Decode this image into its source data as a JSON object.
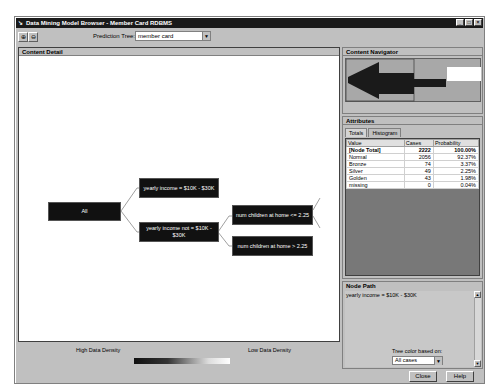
{
  "window": {
    "title": "Data Mining Model Browser - Member Card RDBMS",
    "controls": [
      "minimize",
      "maximize",
      "close"
    ]
  },
  "toolbar": {
    "zoom_in_icon": "zoom-in-icon",
    "zoom_out_icon": "zoom-out-icon",
    "prediction_tree_label": "Prediction Tree:",
    "prediction_tree_value": "member card"
  },
  "content_detail": {
    "title": "Content Detail",
    "nodes": [
      {
        "id": "all",
        "label": "All"
      },
      {
        "id": "income-yes",
        "label": "yearly income = $10K - $30K"
      },
      {
        "id": "income-no",
        "label": "yearly income not = $10K - $30K"
      },
      {
        "id": "children-le",
        "label": "num children at home <= 2.25"
      },
      {
        "id": "children-gt",
        "label": "num children at home > 2.25"
      }
    ]
  },
  "content_navigator": {
    "title": "Content Navigator"
  },
  "attributes": {
    "title": "Attributes",
    "tabs": [
      {
        "label": "Totals",
        "active": true
      },
      {
        "label": "Histogram",
        "active": false
      }
    ],
    "columns": [
      "Value",
      "Cases",
      "Probability"
    ],
    "rows": [
      {
        "value": "[Node Total]",
        "cases": "2222",
        "probability": "100.00%",
        "bold": true
      },
      {
        "value": "Normal",
        "cases": "2056",
        "probability": "92.37%"
      },
      {
        "value": "Bronze",
        "cases": "74",
        "probability": "3.37%"
      },
      {
        "value": "Silver",
        "cases": "49",
        "probability": "2.25%"
      },
      {
        "value": "Golden",
        "cases": "43",
        "probability": "1.98%"
      },
      {
        "value": "missing",
        "cases": "0",
        "probability": "0.04%"
      }
    ]
  },
  "node_path": {
    "title": "Node Path",
    "text": "yearly income = $10K - $30K"
  },
  "legend": {
    "high_label": "High Data Density",
    "low_label": "Low Data Density"
  },
  "tree_color": {
    "label": "Tree color based on:",
    "value": "All cases"
  },
  "buttons": {
    "close": "Close",
    "help": "Help"
  }
}
